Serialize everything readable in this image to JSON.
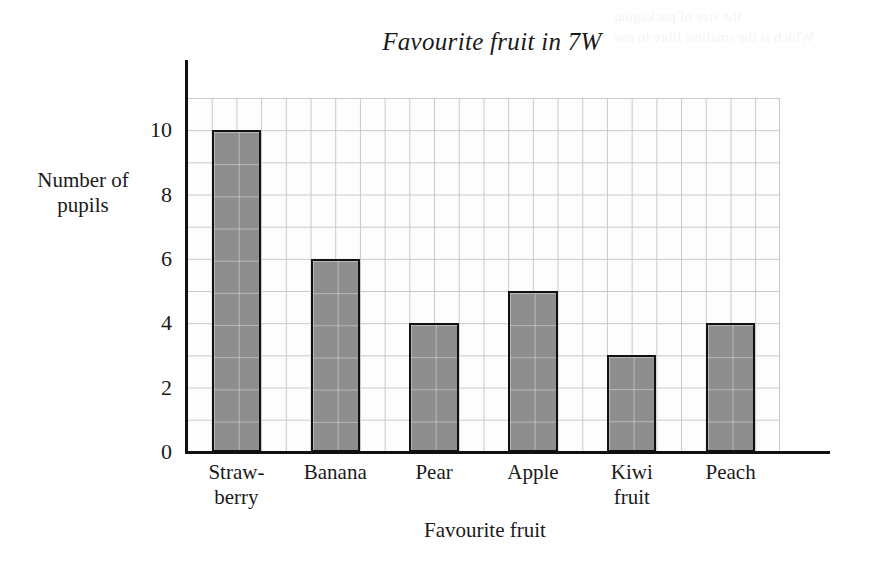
{
  "page": {
    "background_color": "#ffffff",
    "bleed_through_text": "the size of packaging\nWhich is the smallest fibre to use"
  },
  "chart_data": {
    "type": "bar",
    "title": "Favourite fruit in 7W",
    "xlabel": "Favourite fruit",
    "ylabel": "Number\nof\npupils",
    "categories": [
      "Straw-\nberry",
      "Banana",
      "Pear",
      "Apple",
      "Kiwi\nfruit",
      "Peach"
    ],
    "category_names": [
      "Strawberry",
      "Banana",
      "Pear",
      "Apple",
      "Kiwi fruit",
      "Peach"
    ],
    "values": [
      10,
      6,
      4,
      5,
      3,
      4
    ],
    "ylim": [
      0,
      11
    ],
    "ytick_labels": [
      "0",
      "2",
      "4",
      "6",
      "8",
      "10"
    ],
    "ytick_values": [
      0,
      2,
      4,
      6,
      8,
      10
    ],
    "grid": true,
    "grid_minor_step": 1,
    "legend": "none",
    "bar_fill_color": "#8e8e8e",
    "bar_edge_color": "#111111",
    "grid_color": "#c9c9c9",
    "axis_color": "#111111"
  }
}
